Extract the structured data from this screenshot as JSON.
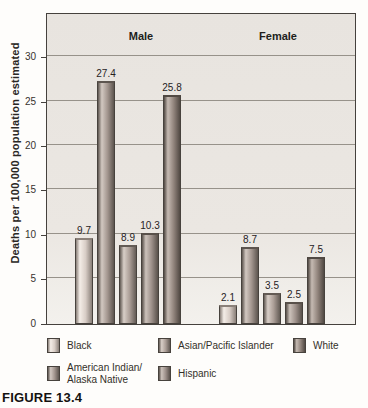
{
  "figure": {
    "caption": "FIGURE 13.4"
  },
  "chart_data": {
    "type": "bar",
    "title": "",
    "xlabel": "",
    "ylabel": "Deaths per 100,000 population estimated",
    "ylim": [
      0,
      30
    ],
    "yticks": [
      0,
      5,
      10,
      15,
      20,
      25,
      30
    ],
    "grid": true,
    "legend_position": "bottom",
    "categories": [
      "Black",
      "American Indian/Alaska Native",
      "Asian/Pacific Islander",
      "Hispanic",
      "White"
    ],
    "series_colors": [
      {
        "hi": "#f4ede7",
        "base": "#d8cdc6",
        "edge": "#8a8079"
      },
      {
        "hi": "#d2c8c1",
        "base": "#a2958e",
        "edge": "#5d554f"
      },
      {
        "hi": "#d8cec7",
        "base": "#ab9e97",
        "edge": "#635b55"
      },
      {
        "hi": "#ccc2bb",
        "base": "#9d908a",
        "edge": "#59514b"
      },
      {
        "hi": "#c5bab2",
        "base": "#92857d",
        "edge": "#514943"
      }
    ],
    "groups": [
      {
        "label": "Male",
        "values": [
          9.7,
          27.4,
          8.9,
          10.3,
          25.8
        ]
      },
      {
        "label": "Female",
        "values": [
          2.1,
          8.7,
          3.5,
          2.5,
          7.5
        ]
      }
    ],
    "legend": {
      "rows": [
        [
          {
            "category": 0,
            "label": "Black"
          },
          {
            "category": 2,
            "label": "Asian/Pacific Islander"
          },
          {
            "category": 4,
            "label": "White"
          }
        ],
        [
          {
            "category": 1,
            "label": "American Indian/\nAlaska Native"
          },
          {
            "category": 3,
            "label": "Hispanic"
          }
        ]
      ]
    }
  }
}
